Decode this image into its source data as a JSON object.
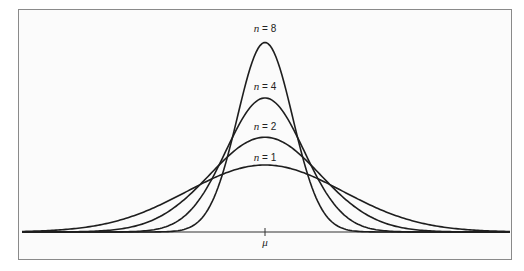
{
  "chart_data": {
    "type": "line",
    "title": "",
    "xlabel": "",
    "ylabel": "",
    "x_tick_labels": [
      "μ"
    ],
    "grid": false,
    "legend": "inline labels above each curve peak",
    "series": [
      {
        "name": "n = 1",
        "n": 1,
        "relative_sd": 1.0,
        "relative_peak": 1.0
      },
      {
        "name": "n = 2",
        "n": 2,
        "relative_sd": 0.707,
        "relative_peak": 1.414
      },
      {
        "name": "n = 4",
        "n": 4,
        "relative_sd": 0.5,
        "relative_peak": 2.0
      },
      {
        "name": "n = 8",
        "n": 8,
        "relative_sd": 0.354,
        "relative_peak": 2.828
      }
    ]
  },
  "labels": {
    "n8": {
      "var": "n",
      "eq": " = 8"
    },
    "n4": {
      "var": "n",
      "eq": " = 4"
    },
    "n2": {
      "var": "n",
      "eq": " = 2"
    },
    "n1": {
      "var": "n",
      "eq": " = 1"
    },
    "mu": "μ"
  },
  "colors": {
    "curve": "#1e1e1e",
    "axis": "#333333",
    "frame": "#8a8a8a"
  }
}
